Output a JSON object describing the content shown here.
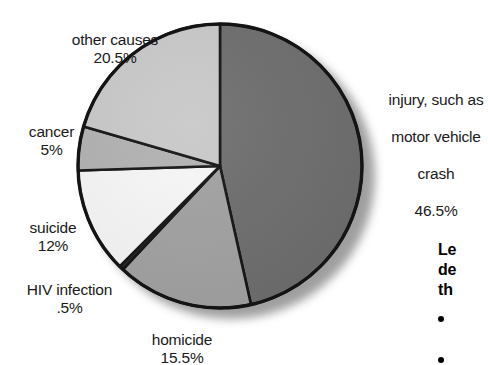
{
  "chart_data": {
    "type": "pie",
    "title": "",
    "categories": [
      "injury, such as motor vehicle crash",
      "homicide",
      "HIV infection",
      "suicide",
      "cancer",
      "other causes"
    ],
    "values": [
      46.5,
      15.5,
      0.5,
      12,
      5,
      20.5
    ],
    "value_labels": [
      "46.5%",
      "15.5%",
      ".5%",
      "12%",
      "5%",
      "20.5%"
    ],
    "slice_colors": [
      "#6e6e6e",
      "#a2a2a2",
      "#2a2a2a",
      "#f7f7f7",
      "#b2b2b2",
      "#c9c9c9"
    ],
    "start_angle_deg": 0,
    "direction": "clockwise",
    "legend": "none",
    "grid": false,
    "units": "percent",
    "total": 100
  },
  "labels": {
    "other_causes": {
      "name": "other causes",
      "value": "20.5%"
    },
    "cancer": {
      "name": "cancer",
      "value": "5%"
    },
    "suicide": {
      "name": "suicide",
      "value": "12%"
    },
    "hiv": {
      "name": "HIV infection",
      "value": ".5%"
    },
    "homicide": {
      "name": "homicide",
      "value": "15.5%"
    },
    "injury": {
      "line1": "injury, such as",
      "line2": "motor vehicle",
      "line3": "crash",
      "value": "46.5%"
    }
  },
  "sidebar_note": {
    "heading_line1": "Le",
    "heading_line2": "de",
    "heading_line3": "th",
    "bullet1": "",
    "bullet2": ""
  },
  "colors": {
    "outline": "#141414",
    "text": "#1a1a1a",
    "background": "#ffffff",
    "shadow": "#9a9a9a"
  }
}
